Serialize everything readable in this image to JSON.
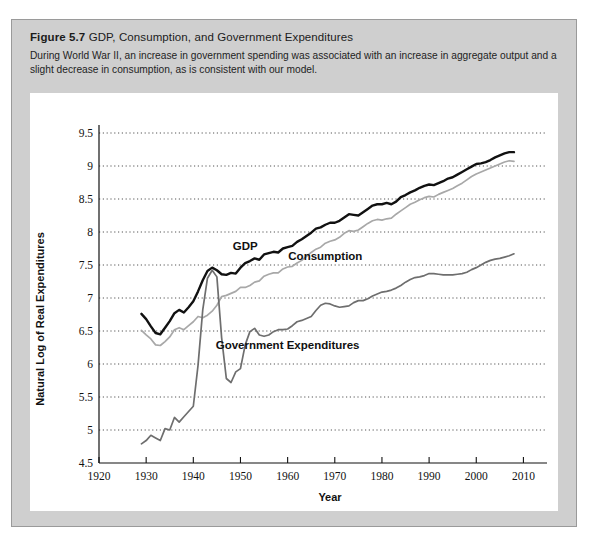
{
  "figure": {
    "number": "Figure 5.7",
    "name": "GDP, Consumption, and Government Expenditures",
    "caption": "During World War II, an increase in government spending was associated with an increase in aggregate output and a slight decrease in consumption, as is consistent with our model."
  },
  "chart_data": {
    "type": "line",
    "title": "GDP, Consumption, and Government Expenditures",
    "xlabel": "Year",
    "ylabel": "Natural Log of Real Expenditures",
    "xlim": [
      1920,
      2015
    ],
    "ylim": [
      4.5,
      9.5
    ],
    "xticks": [
      1920,
      1930,
      1940,
      1950,
      1960,
      1970,
      1980,
      1990,
      2000,
      2010
    ],
    "yticks": [
      4.5,
      5,
      5.5,
      6,
      6.5,
      7,
      7.5,
      8,
      8.5,
      9,
      9.5
    ],
    "xtick_labels": [
      "1920",
      "1930",
      "1940",
      "1950",
      "1960",
      "1970",
      "1980",
      "1990",
      "2000",
      "2010"
    ],
    "ytick_labels": [
      "4.5",
      "5",
      "5.5",
      "6",
      "6.5",
      "7",
      "7.5",
      "8",
      "8.5",
      "9",
      "9.5"
    ],
    "grid": "horizontal-dotted",
    "legend": "inline-annotations",
    "colors": {
      "gdp": "#111111",
      "consumption": "#a8a8a8",
      "government": "#6e6e6e"
    },
    "annotations": [
      {
        "text": "GDP",
        "x": 1951,
        "y": 7.72
      },
      {
        "text": "Consumption",
        "x": 1968,
        "y": 7.57
      },
      {
        "text": "Government Expenditures",
        "x": 1960,
        "y": 6.23
      }
    ],
    "series": [
      {
        "name": "GDP",
        "color": "#111111",
        "x": [
          1929,
          1930,
          1931,
          1932,
          1933,
          1934,
          1935,
          1936,
          1937,
          1938,
          1939,
          1940,
          1941,
          1942,
          1943,
          1944,
          1945,
          1946,
          1947,
          1948,
          1949,
          1950,
          1951,
          1952,
          1953,
          1954,
          1955,
          1956,
          1957,
          1958,
          1959,
          1960,
          1961,
          1962,
          1963,
          1964,
          1965,
          1966,
          1967,
          1968,
          1969,
          1970,
          1971,
          1972,
          1973,
          1974,
          1975,
          1976,
          1977,
          1978,
          1979,
          1980,
          1981,
          1982,
          1983,
          1984,
          1985,
          1986,
          1987,
          1988,
          1989,
          1990,
          1991,
          1992,
          1993,
          1994,
          1995,
          1996,
          1997,
          1998,
          1999,
          2000,
          2001,
          2002,
          2003,
          2004,
          2005,
          2006,
          2007,
          2008
        ],
        "y": [
          6.76,
          6.68,
          6.57,
          6.47,
          6.45,
          6.55,
          6.65,
          6.77,
          6.82,
          6.78,
          6.86,
          6.95,
          7.1,
          7.27,
          7.41,
          7.46,
          7.42,
          7.36,
          7.35,
          7.38,
          7.37,
          7.46,
          7.53,
          7.56,
          7.6,
          7.58,
          7.66,
          7.68,
          7.7,
          7.69,
          7.75,
          7.77,
          7.79,
          7.85,
          7.89,
          7.94,
          7.99,
          8.05,
          8.07,
          8.11,
          8.14,
          8.14,
          8.17,
          8.22,
          8.27,
          8.26,
          8.25,
          8.3,
          8.35,
          8.4,
          8.42,
          8.42,
          8.44,
          8.42,
          8.46,
          8.53,
          8.56,
          8.6,
          8.63,
          8.67,
          8.7,
          8.72,
          8.71,
          8.74,
          8.77,
          8.81,
          8.83,
          8.87,
          8.91,
          8.95,
          8.99,
          9.03,
          9.04,
          9.06,
          9.09,
          9.13,
          9.16,
          9.19,
          9.21,
          9.21
        ]
      },
      {
        "name": "Consumption",
        "color": "#a8a8a8",
        "x": [
          1929,
          1930,
          1931,
          1932,
          1933,
          1934,
          1935,
          1936,
          1937,
          1938,
          1939,
          1940,
          1941,
          1942,
          1943,
          1944,
          1945,
          1946,
          1947,
          1948,
          1949,
          1950,
          1951,
          1952,
          1953,
          1954,
          1955,
          1956,
          1957,
          1958,
          1959,
          1960,
          1961,
          1962,
          1963,
          1964,
          1965,
          1966,
          1967,
          1968,
          1969,
          1970,
          1971,
          1972,
          1973,
          1974,
          1975,
          1976,
          1977,
          1978,
          1979,
          1980,
          1981,
          1982,
          1983,
          1984,
          1985,
          1986,
          1987,
          1988,
          1989,
          1990,
          1991,
          1992,
          1993,
          1994,
          1995,
          1996,
          1997,
          1998,
          1999,
          2000,
          2001,
          2002,
          2003,
          2004,
          2005,
          2006,
          2007,
          2008
        ],
        "y": [
          6.51,
          6.44,
          6.38,
          6.29,
          6.28,
          6.34,
          6.41,
          6.52,
          6.55,
          6.52,
          6.58,
          6.64,
          6.72,
          6.7,
          6.74,
          6.8,
          6.89,
          7.02,
          7.04,
          7.07,
          7.1,
          7.16,
          7.16,
          7.19,
          7.24,
          7.26,
          7.33,
          7.36,
          7.38,
          7.38,
          7.44,
          7.47,
          7.48,
          7.53,
          7.57,
          7.63,
          7.69,
          7.74,
          7.77,
          7.83,
          7.86,
          7.88,
          7.92,
          7.98,
          8.02,
          8.01,
          8.03,
          8.08,
          8.13,
          8.17,
          8.19,
          8.18,
          8.2,
          8.21,
          8.27,
          8.32,
          8.37,
          8.42,
          8.45,
          8.49,
          8.52,
          8.54,
          8.53,
          8.57,
          8.6,
          8.63,
          8.66,
          8.7,
          8.74,
          8.79,
          8.84,
          8.88,
          8.91,
          8.94,
          8.97,
          9.0,
          9.03,
          9.06,
          9.08,
          9.07
        ]
      },
      {
        "name": "Government Expenditures",
        "color": "#6e6e6e",
        "x": [
          1929,
          1930,
          1931,
          1932,
          1933,
          1934,
          1935,
          1936,
          1937,
          1938,
          1939,
          1940,
          1941,
          1942,
          1943,
          1944,
          1945,
          1946,
          1947,
          1948,
          1949,
          1950,
          1951,
          1952,
          1953,
          1954,
          1955,
          1956,
          1957,
          1958,
          1959,
          1960,
          1961,
          1962,
          1963,
          1964,
          1965,
          1966,
          1967,
          1968,
          1969,
          1970,
          1971,
          1972,
          1973,
          1974,
          1975,
          1976,
          1977,
          1978,
          1979,
          1980,
          1981,
          1982,
          1983,
          1984,
          1985,
          1986,
          1987,
          1988,
          1989,
          1990,
          1991,
          1992,
          1993,
          1994,
          1995,
          1996,
          1997,
          1998,
          1999,
          2000,
          2001,
          2002,
          2003,
          2004,
          2005,
          2006,
          2007,
          2008
        ],
        "y": [
          4.79,
          4.84,
          4.92,
          4.88,
          4.84,
          5.02,
          5.0,
          5.19,
          5.12,
          5.2,
          5.28,
          5.36,
          5.98,
          6.82,
          7.3,
          7.42,
          7.32,
          6.4,
          5.78,
          5.72,
          5.88,
          5.93,
          6.29,
          6.49,
          6.54,
          6.44,
          6.42,
          6.44,
          6.49,
          6.52,
          6.52,
          6.53,
          6.58,
          6.64,
          6.66,
          6.69,
          6.72,
          6.81,
          6.89,
          6.92,
          6.91,
          6.88,
          6.86,
          6.87,
          6.88,
          6.93,
          6.96,
          6.96,
          6.99,
          7.03,
          7.06,
          7.09,
          7.1,
          7.12,
          7.15,
          7.19,
          7.24,
          7.28,
          7.31,
          7.32,
          7.34,
          7.37,
          7.37,
          7.36,
          7.35,
          7.35,
          7.35,
          7.36,
          7.37,
          7.39,
          7.43,
          7.46,
          7.5,
          7.54,
          7.57,
          7.59,
          7.6,
          7.62,
          7.64,
          7.67
        ]
      }
    ]
  }
}
